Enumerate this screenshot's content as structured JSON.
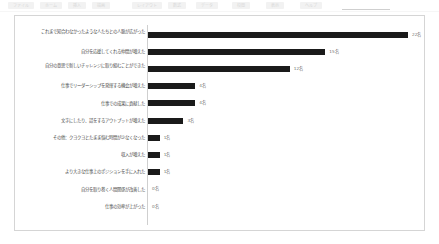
{
  "toolbar": {
    "items": [
      {
        "label": "ファイル",
        "left": 8,
        "width": 26
      },
      {
        "label": "ホーム",
        "left": 40,
        "width": 22
      },
      {
        "label": "挿入",
        "left": 68,
        "width": 18
      },
      {
        "label": "描画",
        "left": 92,
        "width": 18
      },
      {
        "label": "レイアウト",
        "left": 132,
        "width": 30
      },
      {
        "label": "数式",
        "left": 168,
        "width": 18
      },
      {
        "label": "データ",
        "left": 196,
        "width": 22
      },
      {
        "label": "校閲",
        "left": 232,
        "width": 18
      },
      {
        "label": "表示",
        "left": 266,
        "width": 18
      },
      {
        "label": "ヘルプ",
        "left": 300,
        "width": 22
      }
    ],
    "underline": {
      "left": 342,
      "width": 48
    }
  },
  "chart_data": {
    "type": "bar",
    "orientation": "horizontal",
    "title": "",
    "subtitle": "",
    "xlabel": "",
    "ylabel": "",
    "grid": false,
    "legend": false,
    "xlim": [
      0,
      24
    ],
    "unit_suffix": "名",
    "categories": [
      "これまで知合わなかったような人たちとの人脈が広がった",
      "自分を応援してくれる仲間が増えた",
      "自分の意思で新しいチャレンジに取り組むことができた",
      "仕事でリーダーシップを発揮する機会が増えた",
      "仕事での成果に貢献した",
      "文字にしたり、話をするアウトプットが増えた",
      "その他：クヨクヨとたまま悩む時間が少なくなった",
      "収入が増えた",
      "より大きな仕事上のポジションを手に入れた",
      "自分を取り巻く人間関係が改善した",
      "仕事の効率が上がった"
    ],
    "values": [
      22,
      15,
      12,
      4,
      4,
      3,
      1,
      1,
      1,
      0,
      0
    ],
    "value_labels": [
      "22名",
      "15名",
      "12名",
      "4名",
      "4名",
      "3名",
      "1名",
      "1名",
      "1名",
      "0名",
      "0名"
    ]
  }
}
